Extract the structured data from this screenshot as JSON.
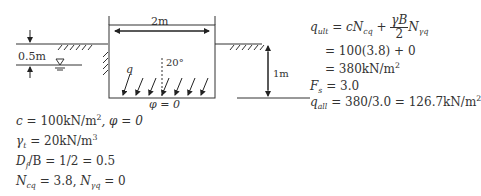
{
  "diagram": {
    "labels": {
      "width": "2m",
      "water_depth": "0.5m",
      "embedment": "1m",
      "load": "q",
      "angle": "20°",
      "phi_base": "φ = 0"
    }
  },
  "givens": {
    "c": {
      "sym": "c",
      "val": " = 100kN/m",
      "exp": "2",
      "tail": ",  φ = 0"
    },
    "gamma": {
      "sym": "γ",
      "sub": "t",
      "val": " = 20kN/m",
      "exp": "3"
    },
    "df": {
      "sym": "D",
      "sub": "f",
      "val": "/B = 1/2 = 0.5"
    },
    "n": {
      "sym1": "N",
      "sub1": "cq",
      "val1": " = 3.8,  ",
      "sym2": "N",
      "sub2": "γq",
      "val2": " = 0"
    }
  },
  "solution": {
    "line1": {
      "lhs": "q",
      "lhs_sub": "ult",
      "eq": " = ",
      "term1": "cN",
      "term1_sub": "cq",
      "plus": " + ",
      "frac_num": "γB",
      "frac_den": "2",
      "term2": "N",
      "term2_sub": "γq"
    },
    "line2": "= 100(3.8) + 0",
    "line3": {
      "text": "= 380kN/m",
      "exp": "2"
    },
    "line4": {
      "sym": "F",
      "sub": "s",
      "val": " = 3.0"
    },
    "line5": {
      "sym": "q",
      "sub": "all",
      "val": " = 380/3.0 = 126.7kN/m",
      "exp": "2"
    }
  }
}
